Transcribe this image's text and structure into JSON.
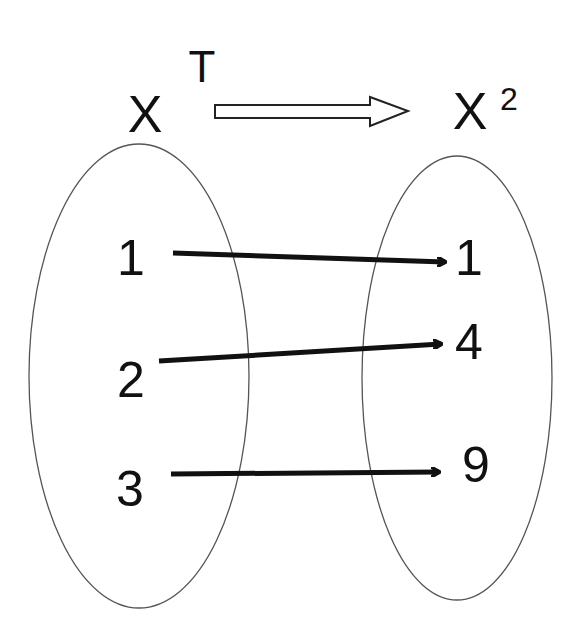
{
  "diagram": {
    "transform_label": "T",
    "domain_set": {
      "label": "X",
      "elements": [
        "1",
        "2",
        "3"
      ]
    },
    "codomain_set": {
      "label": "X",
      "superscript": "2",
      "elements": [
        "1",
        "4",
        "9"
      ]
    },
    "mappings": [
      {
        "from": "1",
        "to": "1"
      },
      {
        "from": "2",
        "to": "4"
      },
      {
        "from": "3",
        "to": "9"
      }
    ],
    "colors": {
      "stroke": "#111111",
      "ellipse": "#555555",
      "background": "#ffffff"
    }
  }
}
